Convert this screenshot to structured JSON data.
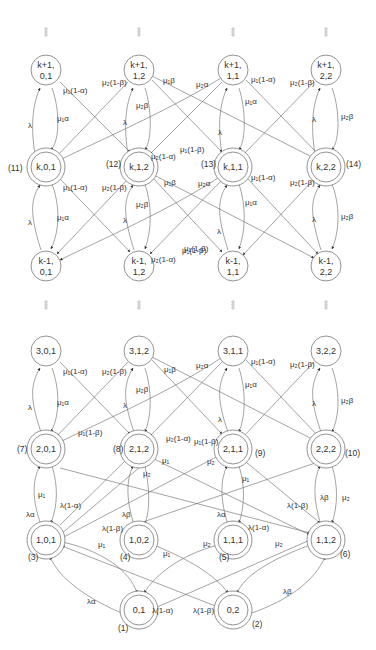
{
  "diagram": {
    "top_section": {
      "ellipsis_symbol": "⋮",
      "nodes": [
        {
          "id": "k+1,0,1",
          "line1": "k+1,",
          "line2": "0,1",
          "x": 46,
          "y": 70,
          "double": false
        },
        {
          "id": "k+1,1,2",
          "line1": "k+1,",
          "line2": "1,2",
          "x": 139,
          "y": 70,
          "double": false
        },
        {
          "id": "k+1,1,1",
          "line1": "k+1,",
          "line2": "1,1",
          "x": 233,
          "y": 70,
          "double": false
        },
        {
          "id": "k+1,2,2",
          "line1": "k+1,",
          "line2": "2,2",
          "x": 326,
          "y": 70,
          "double": false
        },
        {
          "id": "k,0,1",
          "line1": "k,0,1",
          "line2": "",
          "x": 46,
          "y": 167,
          "double": true,
          "state_number": "(11)",
          "num_x": 8,
          "num_y": 171
        },
        {
          "id": "k,1,2",
          "line1": "k,1,2",
          "line2": "",
          "x": 139,
          "y": 167,
          "double": true,
          "state_number": "(12)",
          "num_x": 106,
          "num_y": 167
        },
        {
          "id": "k,1,1",
          "line1": "k,1,1",
          "line2": "",
          "x": 233,
          "y": 167,
          "double": true,
          "state_number": "(13)",
          "num_x": 201,
          "num_y": 167
        },
        {
          "id": "k,2,2",
          "line1": "k,2,2",
          "line2": "",
          "x": 326,
          "y": 167,
          "double": true,
          "state_number": "(14)",
          "num_x": 346,
          "num_y": 167
        },
        {
          "id": "k-1,0,1",
          "line1": "k-1,",
          "line2": "0,1",
          "x": 46,
          "y": 266,
          "double": false
        },
        {
          "id": "k-1,1,2",
          "line1": "k-1,",
          "line2": "1,2",
          "x": 139,
          "y": 266,
          "double": false
        },
        {
          "id": "k-1,1,1",
          "line1": "k-1,",
          "line2": "1,1",
          "x": 233,
          "y": 266,
          "double": false
        },
        {
          "id": "k-1,2,2",
          "line1": "k-1,",
          "line2": "2,2",
          "x": 326,
          "y": 266,
          "double": false
        }
      ],
      "edge_labels": [
        {
          "text": "μ₁(1-α)",
          "x": 63,
          "y": 93
        },
        {
          "text": "λ",
          "x": 28,
          "y": 128
        },
        {
          "text": "μ₁α",
          "x": 57,
          "y": 121
        },
        {
          "text": "μ₂(1-β)",
          "x": 102,
          "y": 85
        },
        {
          "text": "μ₁β",
          "x": 163,
          "y": 83
        },
        {
          "text": "μ₂β",
          "x": 136,
          "y": 108
        },
        {
          "text": "λ",
          "x": 123,
          "y": 125
        },
        {
          "text": "μ₂(1-α)",
          "x": 151,
          "y": 159
        },
        {
          "text": "μ₁(1-β)",
          "x": 180,
          "y": 152
        },
        {
          "text": "μ₂α",
          "x": 196,
          "y": 87
        },
        {
          "text": "μ₁(1-α)",
          "x": 251,
          "y": 82
        },
        {
          "text": "μ₁α",
          "x": 245,
          "y": 104
        },
        {
          "text": "λ",
          "x": 218,
          "y": 135
        },
        {
          "text": "μ₂(1-β)",
          "x": 290,
          "y": 85
        },
        {
          "text": "λ",
          "x": 312,
          "y": 122
        },
        {
          "text": "μ₂β",
          "x": 341,
          "y": 119
        },
        {
          "text": "μ₁(1-α)",
          "x": 63,
          "y": 190
        },
        {
          "text": "λ",
          "x": 28,
          "y": 225
        },
        {
          "text": "μ₁α",
          "x": 57,
          "y": 220
        },
        {
          "text": "μ₂(1-β)",
          "x": 102,
          "y": 190
        },
        {
          "text": "μ₁β",
          "x": 164,
          "y": 185
        },
        {
          "text": "μ₂β",
          "x": 136,
          "y": 207
        },
        {
          "text": "λ",
          "x": 123,
          "y": 223
        },
        {
          "text": "μ₂(1-α)",
          "x": 151,
          "y": 262
        },
        {
          "text": "μ₁(1-β)",
          "x": 182,
          "y": 253
        },
        {
          "text": "μ₂α",
          "x": 198,
          "y": 186
        },
        {
          "text": "μ₁(1-α)",
          "x": 251,
          "y": 180
        },
        {
          "text": "μ₁α",
          "x": 245,
          "y": 205
        },
        {
          "text": "λ",
          "x": 217,
          "y": 234
        },
        {
          "text": "μ₁(1-β)",
          "x": 184,
          "y": 251
        },
        {
          "text": "μ₂(1-β)",
          "x": 290,
          "y": 185
        },
        {
          "text": "λ",
          "x": 312,
          "y": 222
        },
        {
          "text": "μ₂β",
          "x": 341,
          "y": 219
        }
      ]
    },
    "bottom_section": {
      "nodes": [
        {
          "id": "3,0,1",
          "line1": "3,0,1",
          "x": 46,
          "y": 351,
          "double": false
        },
        {
          "id": "3,1,2",
          "line1": "3,1,2",
          "x": 139,
          "y": 351,
          "double": false
        },
        {
          "id": "3,1,1",
          "line1": "3,1,1",
          "x": 233,
          "y": 351,
          "double": false
        },
        {
          "id": "3,2,2",
          "line1": "3,2,2",
          "x": 326,
          "y": 351,
          "double": false
        },
        {
          "id": "2,0,1",
          "line1": "2,0,1",
          "x": 46,
          "y": 449,
          "double": true,
          "state_number": "(7)",
          "num_x": 17,
          "num_y": 452
        },
        {
          "id": "2,1,2",
          "line1": "2,1,2",
          "x": 139,
          "y": 449,
          "double": true,
          "state_number": "(8)",
          "num_x": 113,
          "num_y": 452
        },
        {
          "id": "2,1,1",
          "line1": "2,1,1",
          "x": 233,
          "y": 449,
          "double": true,
          "state_number": "(9)",
          "num_x": 255,
          "num_y": 456
        },
        {
          "id": "2,2,2",
          "line1": "2,2,2",
          "x": 326,
          "y": 449,
          "double": true,
          "state_number": "(10)",
          "num_x": 345,
          "num_y": 456
        },
        {
          "id": "1,0,1",
          "line1": "1,0,1",
          "x": 46,
          "y": 540,
          "double": true,
          "state_number": "(3)",
          "num_x": 28,
          "num_y": 560
        },
        {
          "id": "1,0,2",
          "line1": "1,0,2",
          "x": 139,
          "y": 540,
          "double": true,
          "state_number": "(4)",
          "num_x": 120,
          "num_y": 560
        },
        {
          "id": "1,1,1",
          "line1": "1,1,1",
          "x": 233,
          "y": 540,
          "double": true,
          "state_number": "(5)",
          "num_x": 219,
          "num_y": 560
        },
        {
          "id": "1,1,2",
          "line1": "1,1,2",
          "x": 326,
          "y": 540,
          "double": true,
          "state_number": "(6)",
          "num_x": 340,
          "num_y": 557
        },
        {
          "id": "0,1",
          "line1": "0,1",
          "x": 139,
          "y": 610,
          "double": true,
          "state_number": "(1)",
          "num_x": 118,
          "num_y": 631
        },
        {
          "id": "0,2",
          "line1": "0,2",
          "x": 233,
          "y": 610,
          "double": true,
          "state_number": "(2)",
          "num_x": 252,
          "num_y": 627
        }
      ],
      "edge_labels": [
        {
          "text": "μ₁(1-α)",
          "x": 63,
          "y": 374
        },
        {
          "text": "λ",
          "x": 28,
          "y": 410
        },
        {
          "text": "μ₁α",
          "x": 57,
          "y": 405
        },
        {
          "text": "μ₂(1-β)",
          "x": 102,
          "y": 374
        },
        {
          "text": "μ₁β",
          "x": 164,
          "y": 372
        },
        {
          "text": "μ₂β",
          "x": 136,
          "y": 392
        },
        {
          "text": "λ",
          "x": 123,
          "y": 408
        },
        {
          "text": "μ₁(1-β)",
          "x": 78,
          "y": 435
        },
        {
          "text": "μ₂(1-α)",
          "x": 166,
          "y": 441
        },
        {
          "text": "μ₂α",
          "x": 196,
          "y": 368
        },
        {
          "text": "μ₁(1-α)",
          "x": 251,
          "y": 364
        },
        {
          "text": "μ₁α",
          "x": 245,
          "y": 387
        },
        {
          "text": "λ",
          "x": 218,
          "y": 422
        },
        {
          "text": "μ₁(1-β)",
          "x": 194,
          "y": 444
        },
        {
          "text": "μ₂(1-β)",
          "x": 290,
          "y": 367
        },
        {
          "text": "λ",
          "x": 312,
          "y": 406
        },
        {
          "text": "μ₂β",
          "x": 341,
          "y": 403
        },
        {
          "text": "μ₁",
          "x": 162,
          "y": 463
        },
        {
          "text": "μ₂",
          "x": 143,
          "y": 476
        },
        {
          "text": "μ₂",
          "x": 207,
          "y": 464
        },
        {
          "text": "μ₁",
          "x": 242,
          "y": 481
        },
        {
          "text": "μ₁",
          "x": 38,
          "y": 497
        },
        {
          "text": "λα",
          "x": 26,
          "y": 517
        },
        {
          "text": "λ(1-α)",
          "x": 60,
          "y": 508
        },
        {
          "text": "λβ",
          "x": 122,
          "y": 517
        },
        {
          "text": "λ(1-β)",
          "x": 102,
          "y": 531
        },
        {
          "text": "μ₁",
          "x": 98,
          "y": 547
        },
        {
          "text": "μ₁",
          "x": 163,
          "y": 556
        },
        {
          "text": "λα",
          "x": 217,
          "y": 517
        },
        {
          "text": "λ(1-α)",
          "x": 248,
          "y": 530
        },
        {
          "text": "μ₂",
          "x": 203,
          "y": 546
        },
        {
          "text": "μ₂",
          "x": 275,
          "y": 546
        },
        {
          "text": "λ(1-β)",
          "x": 287,
          "y": 508
        },
        {
          "text": "λβ",
          "x": 320,
          "y": 500
        },
        {
          "text": "μ₂",
          "x": 342,
          "y": 500
        },
        {
          "text": "λα",
          "x": 87,
          "y": 604
        },
        {
          "text": "λ(1-α)",
          "x": 152,
          "y": 613
        },
        {
          "text": "λ(1-β)",
          "x": 193,
          "y": 613
        },
        {
          "text": "λβ",
          "x": 283,
          "y": 594
        }
      ]
    }
  }
}
